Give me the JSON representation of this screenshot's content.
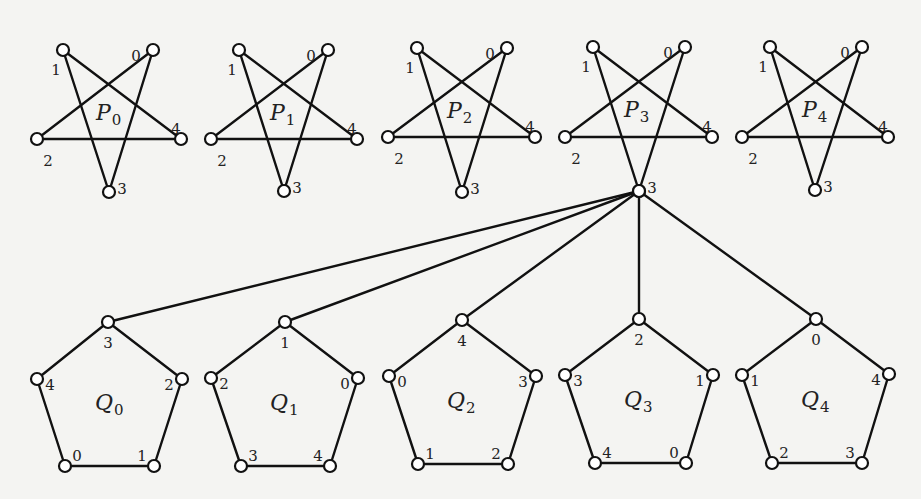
{
  "colors": {
    "ink": "#111111",
    "background": "#f4f4f2",
    "node_fill": "#ffffff"
  },
  "hub": {
    "graph": "P3",
    "vertex": "3"
  },
  "stars": [
    {
      "name": "P",
      "sub": "0",
      "offset_x": 0,
      "vertices": [
        {
          "id": "1",
          "x": 63,
          "y": 50
        },
        {
          "id": "0",
          "x": 153,
          "y": 50
        },
        {
          "id": "2",
          "x": 37,
          "y": 139
        },
        {
          "id": "4",
          "x": 181,
          "y": 139
        },
        {
          "id": "3",
          "x": 109,
          "y": 192
        }
      ],
      "label_x": 96,
      "label_y": 120
    },
    {
      "name": "P",
      "sub": "1",
      "vertices": [
        {
          "id": "1",
          "x": 239,
          "y": 50
        },
        {
          "id": "0",
          "x": 328,
          "y": 50
        },
        {
          "id": "2",
          "x": 211,
          "y": 139
        },
        {
          "id": "4",
          "x": 357,
          "y": 139
        },
        {
          "id": "3",
          "x": 284,
          "y": 191
        }
      ],
      "label_x": 270,
      "label_y": 120
    },
    {
      "name": "P",
      "sub": "2",
      "vertices": [
        {
          "id": "1",
          "x": 417,
          "y": 48
        },
        {
          "id": "0",
          "x": 507,
          "y": 48
        },
        {
          "id": "2",
          "x": 388,
          "y": 137
        },
        {
          "id": "4",
          "x": 535,
          "y": 137
        },
        {
          "id": "3",
          "x": 462,
          "y": 192
        }
      ],
      "label_x": 447,
      "label_y": 118
    },
    {
      "name": "P",
      "sub": "3",
      "vertices": [
        {
          "id": "1",
          "x": 593,
          "y": 47
        },
        {
          "id": "0",
          "x": 685,
          "y": 47
        },
        {
          "id": "2",
          "x": 565,
          "y": 137
        },
        {
          "id": "4",
          "x": 712,
          "y": 137
        },
        {
          "id": "3",
          "x": 639,
          "y": 191
        }
      ],
      "label_x": 624,
      "label_y": 117
    },
    {
      "name": "P",
      "sub": "4",
      "vertices": [
        {
          "id": "1",
          "x": 770,
          "y": 47
        },
        {
          "id": "0",
          "x": 862,
          "y": 47
        },
        {
          "id": "2",
          "x": 742,
          "y": 137
        },
        {
          "id": "4",
          "x": 888,
          "y": 137
        },
        {
          "id": "3",
          "x": 815,
          "y": 190
        }
      ],
      "label_x": 802,
      "label_y": 117
    }
  ],
  "star_edges": [
    [
      "1",
      "4"
    ],
    [
      "1",
      "3"
    ],
    [
      "0",
      "2"
    ],
    [
      "0",
      "3"
    ],
    [
      "2",
      "4"
    ]
  ],
  "pentagons": [
    {
      "name": "Q",
      "sub": "0",
      "vertices": [
        {
          "pos": "top",
          "id": "3",
          "x": 108,
          "y": 322
        },
        {
          "pos": "left",
          "id": "4",
          "x": 37,
          "y": 379
        },
        {
          "pos": "right",
          "id": "2",
          "x": 182,
          "y": 379
        },
        {
          "pos": "bl",
          "id": "0",
          "x": 65,
          "y": 466
        },
        {
          "pos": "br",
          "id": "1",
          "x": 154,
          "y": 466
        }
      ],
      "label_x": 95,
      "label_y": 410
    },
    {
      "name": "Q",
      "sub": "1",
      "vertices": [
        {
          "pos": "top",
          "id": "1",
          "x": 285,
          "y": 322
        },
        {
          "pos": "left",
          "id": "2",
          "x": 211,
          "y": 378
        },
        {
          "pos": "right",
          "id": "0",
          "x": 358,
          "y": 378
        },
        {
          "pos": "bl",
          "id": "3",
          "x": 241,
          "y": 466
        },
        {
          "pos": "br",
          "id": "4",
          "x": 330,
          "y": 466
        }
      ],
      "label_x": 270,
      "label_y": 410
    },
    {
      "name": "Q",
      "sub": "2",
      "vertices": [
        {
          "pos": "top",
          "id": "4",
          "x": 462,
          "y": 320
        },
        {
          "pos": "left",
          "id": "0",
          "x": 389,
          "y": 376
        },
        {
          "pos": "right",
          "id": "3",
          "x": 536,
          "y": 376
        },
        {
          "pos": "bl",
          "id": "1",
          "x": 418,
          "y": 464
        },
        {
          "pos": "br",
          "id": "2",
          "x": 508,
          "y": 464
        }
      ],
      "label_x": 447,
      "label_y": 408
    },
    {
      "name": "Q",
      "sub": "3",
      "vertices": [
        {
          "pos": "top",
          "id": "2",
          "x": 639,
          "y": 319
        },
        {
          "pos": "left",
          "id": "3",
          "x": 565,
          "y": 375
        },
        {
          "pos": "right",
          "id": "1",
          "x": 713,
          "y": 375
        },
        {
          "pos": "bl",
          "id": "4",
          "x": 595,
          "y": 463
        },
        {
          "pos": "br",
          "id": "0",
          "x": 686,
          "y": 463
        }
      ],
      "label_x": 624,
      "label_y": 407
    },
    {
      "name": "Q",
      "sub": "4",
      "vertices": [
        {
          "pos": "top",
          "id": "0",
          "x": 816,
          "y": 319
        },
        {
          "pos": "left",
          "id": "1",
          "x": 742,
          "y": 375
        },
        {
          "pos": "right",
          "id": "4",
          "x": 889,
          "y": 374
        },
        {
          "pos": "bl",
          "id": "2",
          "x": 772,
          "y": 463
        },
        {
          "pos": "br",
          "id": "3",
          "x": 862,
          "y": 463
        }
      ],
      "label_x": 801,
      "label_y": 407
    }
  ],
  "pentagon_edges": [
    [
      "top",
      "right"
    ],
    [
      "right",
      "br"
    ],
    [
      "br",
      "bl"
    ],
    [
      "bl",
      "left"
    ],
    [
      "left",
      "top"
    ]
  ],
  "hub_edges": [
    {
      "to": "Q0.top"
    },
    {
      "to": "Q1.top"
    },
    {
      "to": "Q2.top"
    },
    {
      "to": "Q3.top"
    },
    {
      "to": "Q4.top"
    }
  ]
}
